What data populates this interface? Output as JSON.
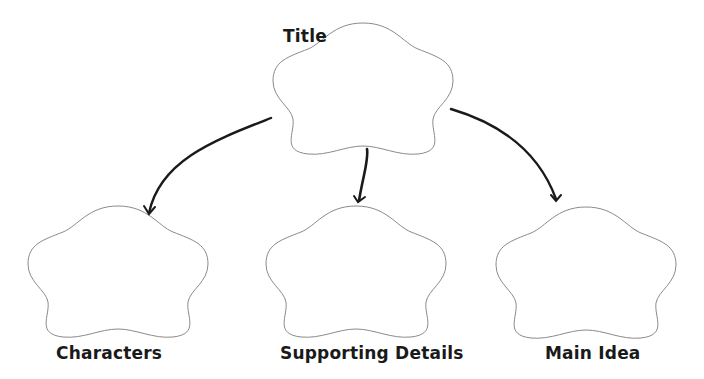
{
  "diagram": {
    "type": "graphic-organizer",
    "colors": {
      "outline": "#8a8a8a",
      "arrow": "#1a1a1a",
      "text": "#1a1a1a",
      "background": "#ffffff"
    },
    "nodes": [
      {
        "id": "title",
        "label": "Title"
      },
      {
        "id": "characters",
        "label": "Characters"
      },
      {
        "id": "supporting-details",
        "label": "Supporting Details"
      },
      {
        "id": "main-idea",
        "label": "Main Idea"
      }
    ],
    "edges": [
      {
        "from": "title",
        "to": "characters"
      },
      {
        "from": "title",
        "to": "supporting-details"
      },
      {
        "from": "title",
        "to": "main-idea"
      }
    ]
  }
}
